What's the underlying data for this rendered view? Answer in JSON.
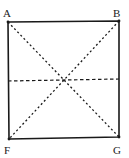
{
  "diagram": {
    "type": "geometry-square",
    "labels": {
      "top_left": "A",
      "top_right": "B",
      "bottom_left": "F",
      "bottom_right": "G"
    },
    "points": {
      "A": [
        8,
        22
      ],
      "B": [
        119,
        21
      ],
      "F": [
        9,
        139
      ],
      "G": [
        119,
        137
      ]
    },
    "lines": [
      {
        "from": "A",
        "to": "G",
        "style": "dotted"
      },
      {
        "from": "B",
        "to": "F",
        "style": "dotted"
      },
      {
        "from": "left-mid",
        "to": "right-mid",
        "style": "dashed"
      }
    ],
    "colors": {
      "stroke": "#1a1a1a",
      "background": "#ffffff"
    }
  }
}
